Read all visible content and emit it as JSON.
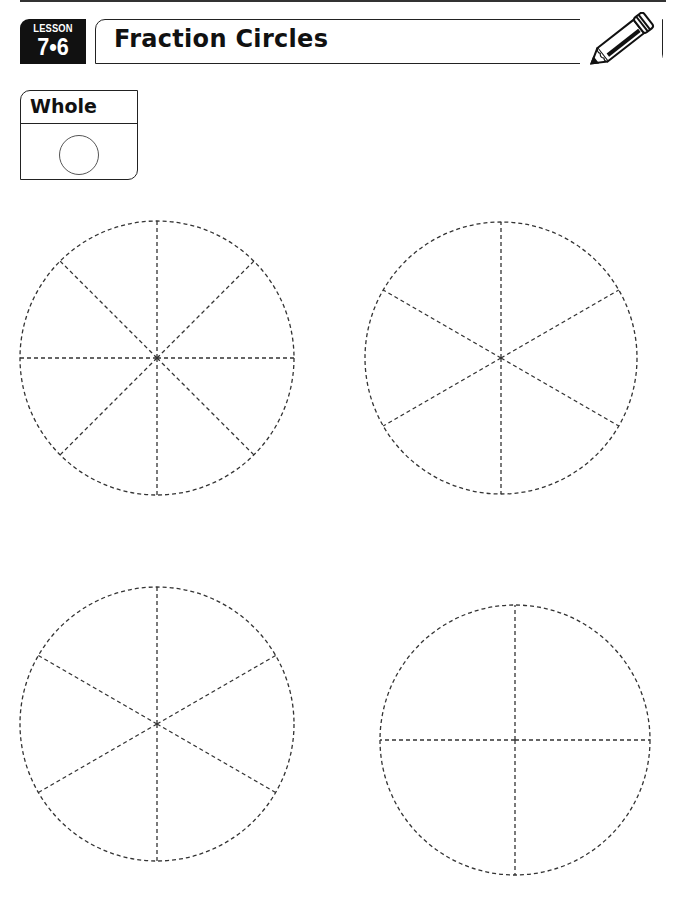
{
  "header": {
    "lesson_label": "LESSON",
    "lesson_number": "7•6",
    "title": "Fraction Circles",
    "icon": "pencil-icon"
  },
  "whole_box": {
    "label": "Whole",
    "icon": "whole-circle"
  },
  "circles": [
    {
      "name": "circle-eighths",
      "sections": 8,
      "cx": 157,
      "cy": 358,
      "r": 137
    },
    {
      "name": "circle-sixths-a",
      "sections": 6,
      "cx": 501,
      "cy": 358,
      "r": 136
    },
    {
      "name": "circle-sixths-b",
      "sections": 6,
      "cx": 157,
      "cy": 724,
      "r": 137
    },
    {
      "name": "circle-fourths",
      "sections": 4,
      "cx": 515,
      "cy": 740,
      "r": 135
    }
  ],
  "colors": {
    "ink": "#222222",
    "badge": "#111111",
    "paper": "#ffffff"
  }
}
